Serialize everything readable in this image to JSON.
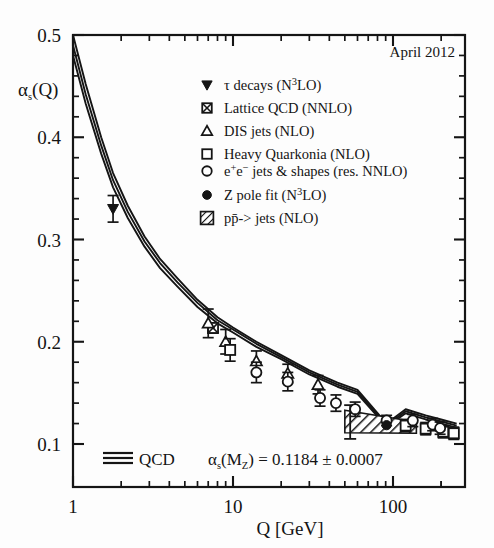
{
  "figure": {
    "date_label": "April 2012",
    "background": "#fdfdfd",
    "frame_color": "#151515"
  },
  "axes": {
    "y_title": "αs(Q)",
    "y_title_main": "α",
    "y_title_sub": "s",
    "y_title_tail": "(Q)",
    "x_title": "Q [GeV]",
    "x_tick_labels": [
      "1",
      "10",
      "100"
    ],
    "y_tick_labels": [
      "0.1",
      "0.2",
      "0.3",
      "0.4",
      "0.5"
    ]
  },
  "annotation": {
    "qcd_label": "QCD",
    "alpha_label_main": "α",
    "alpha_label_sub": "s",
    "alpha_label_mz": "(M",
    "alpha_label_mz_sub": "Z",
    "alpha_label_close": ")",
    "value_text": "= 0.1184 ± 0.0007",
    "full_text": "αs(MZ) = 0.1184 ± 0.0007",
    "alpha_s_mz": 0.1184,
    "alpha_s_mz_error": 0.0007
  },
  "legend": {
    "entries": [
      {
        "marker": "filled-down-triangle",
        "label": "τ decays (N3LO)",
        "text_pre": "τ decays (N",
        "sup": "3",
        "text_post": "LO)"
      },
      {
        "marker": "crossed-square",
        "label": "Lattice QCD (NNLO)",
        "text_pre": "Lattice QCD (NNLO)",
        "sup": "",
        "text_post": ""
      },
      {
        "marker": "open-triangle",
        "label": "DIS jets (NLO)",
        "text_pre": "DIS jets (NLO)",
        "sup": "",
        "text_post": ""
      },
      {
        "marker": "open-square",
        "label": "Heavy Quarkonia (NLO)",
        "text_pre": "Heavy Quarkonia (NLO)",
        "sup": "",
        "text_post": ""
      },
      {
        "marker": "open-circle",
        "label": "e+e- jets & shapes (res. NNLO)",
        "text_pre": "e",
        "sup": "+",
        "text_post": "e"
      },
      {
        "marker": "filled-circle",
        "label": "Z pole fit (N3LO)",
        "text_pre": "Z pole fit (N",
        "sup": "3",
        "text_post": "LO)"
      },
      {
        "marker": "hatched-square",
        "label": "pp̄-> jets (NLO)",
        "text_pre": "pp̄-> jets (NLO)",
        "sup": "",
        "text_post": ""
      }
    ],
    "ee_label_parts": {
      "a": "e",
      "sup1": "+",
      "b": "e",
      "sup2": "−",
      "c": " jets & shapes (res. NNLO)"
    }
  },
  "chart_data": {
    "type": "scatter",
    "title": "",
    "xlabel": "Q [GeV]",
    "ylabel": "αs(Q)",
    "xscale": "log",
    "yscale": "linear",
    "xlim": [
      1,
      250
    ],
    "ylim": [
      0.08,
      0.5
    ],
    "grid": false,
    "legend_position": "upper-right",
    "qcd_band": {
      "name": "QCD running coupling",
      "alpha_s_mz": 0.1184,
      "alpha_s_mz_error": 0.0007,
      "n_lines": 3,
      "curve_q": [
        1.0,
        1.2,
        1.5,
        1.78,
        2.2,
        2.8,
        3.5,
        4.5,
        6.0,
        8.0,
        10.0,
        14.0,
        20.0,
        30.0,
        45.0,
        60.0,
        91.2,
        120.0,
        160.0,
        200.0,
        250.0
      ],
      "curve_alpha_central": [
        0.49,
        0.442,
        0.392,
        0.358,
        0.327,
        0.298,
        0.277,
        0.258,
        0.238,
        0.221,
        0.212,
        0.198,
        0.185,
        0.17,
        0.158,
        0.151,
        0.1184,
        0.132,
        0.126,
        0.122,
        0.118
      ],
      "curve_alpha_upper": [
        0.5,
        0.452,
        0.4,
        0.365,
        0.333,
        0.303,
        0.281,
        0.262,
        0.241,
        0.224,
        0.214,
        0.2,
        0.187,
        0.172,
        0.16,
        0.153,
        0.12,
        0.134,
        0.128,
        0.124,
        0.12
      ],
      "curve_alpha_lower": [
        0.48,
        0.433,
        0.384,
        0.351,
        0.321,
        0.293,
        0.272,
        0.254,
        0.234,
        0.218,
        0.209,
        0.195,
        0.183,
        0.168,
        0.156,
        0.149,
        0.117,
        0.13,
        0.124,
        0.12,
        0.116
      ]
    },
    "series": [
      {
        "name": "τ decays (N3LO)",
        "marker": "filled-down-triangle",
        "points": [
          {
            "q": 1.78,
            "alpha": 0.33,
            "err": 0.013
          }
        ]
      },
      {
        "name": "Lattice QCD (NNLO)",
        "marker": "crossed-square",
        "points": [
          {
            "q": 7.5,
            "alpha": 0.2135,
            "err": 0.005
          }
        ]
      },
      {
        "name": "DIS jets (NLO)",
        "marker": "open-triangle",
        "points": [
          {
            "q": 7.0,
            "alpha": 0.218,
            "err": 0.014
          },
          {
            "q": 9.0,
            "alpha": 0.2,
            "err": 0.012
          },
          {
            "q": 14.0,
            "alpha": 0.181,
            "err": 0.01
          },
          {
            "q": 22.0,
            "alpha": 0.169,
            "err": 0.009
          },
          {
            "q": 34.0,
            "alpha": 0.158,
            "err": 0.009
          }
        ]
      },
      {
        "name": "Heavy Quarkonia (NLO)",
        "marker": "open-square",
        "points": [
          {
            "q": 9.6,
            "alpha": 0.192,
            "err": 0.011
          },
          {
            "q": 120.0,
            "alpha": 0.118,
            "err": 0.006
          },
          {
            "q": 160.0,
            "alpha": 0.115,
            "err": 0.006
          },
          {
            "q": 206.0,
            "alpha": 0.112,
            "err": 0.006
          },
          {
            "q": 240.0,
            "alpha": 0.1105,
            "err": 0.006
          }
        ]
      },
      {
        "name": "e+e- jets & shapes (res. NNLO)",
        "marker": "open-circle",
        "points": [
          {
            "q": 14.0,
            "alpha": 0.17,
            "err": 0.01
          },
          {
            "q": 22.0,
            "alpha": 0.161,
            "err": 0.009
          },
          {
            "q": 35.0,
            "alpha": 0.145,
            "err": 0.008
          },
          {
            "q": 44.0,
            "alpha": 0.14,
            "err": 0.008
          },
          {
            "q": 58.0,
            "alpha": 0.134,
            "err": 0.007
          },
          {
            "q": 91.2,
            "alpha": 0.123,
            "err": 0.005
          },
          {
            "q": 133.0,
            "alpha": 0.123,
            "err": 0.006
          },
          {
            "q": 177.0,
            "alpha": 0.119,
            "err": 0.006
          },
          {
            "q": 197.0,
            "alpha": 0.1155,
            "err": 0.006
          }
        ]
      },
      {
        "name": "Z pole fit (N3LO)",
        "marker": "filled-circle",
        "points": [
          {
            "q": 91.2,
            "alpha": 0.1184,
            "err": 0.0007
          }
        ]
      },
      {
        "name": "pp̄-> jets (NLO)",
        "marker": "hatched-band",
        "band": {
          "q_start": 50.0,
          "q_end": 140.0,
          "alpha_upper_start": 0.133,
          "alpha_lower_start": 0.111,
          "alpha_upper_end": 0.1215,
          "alpha_lower_end": 0.1105,
          "err_bar_q": 54.0,
          "err_bar_alpha": 0.1215,
          "err_bar_err": 0.0165
        }
      }
    ]
  }
}
